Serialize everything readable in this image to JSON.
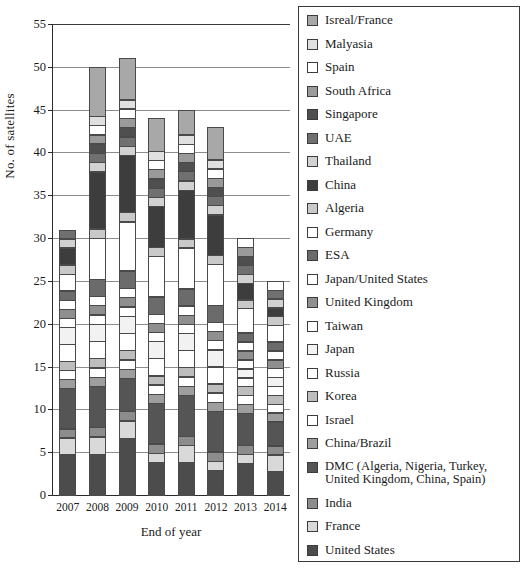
{
  "chart_data": {
    "type": "bar",
    "stacked": true,
    "title": "",
    "xlabel": "End of year",
    "ylabel": "No. of satellites",
    "categories": [
      "2007",
      "2008",
      "2009",
      "2010",
      "2011",
      "2012",
      "2013",
      "2014"
    ],
    "ylim": [
      0,
      55
    ],
    "yticks": [
      0,
      5,
      10,
      15,
      20,
      25,
      30,
      35,
      40,
      45,
      50,
      55
    ],
    "grid": true,
    "legend_position": "right",
    "totals": [
      31,
      49,
      51,
      44,
      45,
      42,
      29,
      24
    ],
    "series": [
      {
        "name": "United States",
        "color": "#4c4c4c",
        "values": [
          5,
          5,
          7,
          4,
          4,
          3,
          4,
          3
        ]
      },
      {
        "name": "France",
        "color": "#d9d9d9",
        "values": [
          2,
          2,
          2,
          1,
          2,
          1,
          1,
          2
        ]
      },
      {
        "name": "India",
        "color": "#8c8c8c",
        "values": [
          1,
          1,
          1,
          1,
          1,
          1,
          1,
          1
        ]
      },
      {
        "name": "DMC (Algeria, Nigeria, Turkey,\nUnited Kingdom, China, Spain)",
        "color": "#555555",
        "values": [
          5,
          5,
          4,
          5,
          5,
          5,
          4,
          3
        ]
      },
      {
        "name": "China/Brazil",
        "color": "#9e9e9e",
        "values": [
          1,
          1,
          1,
          1,
          1,
          1,
          1,
          1
        ]
      },
      {
        "name": "Israel",
        "color": "#ffffff",
        "values": [
          1,
          1,
          1,
          1,
          1,
          1,
          1,
          1
        ]
      },
      {
        "name": "Korea",
        "color": "#bdbdbd",
        "values": [
          1,
          1,
          1,
          1,
          1,
          1,
          1,
          1
        ]
      },
      {
        "name": "Russia",
        "color": "#ffffff",
        "values": [
          2,
          2,
          2,
          2,
          2,
          2,
          1,
          1
        ]
      },
      {
        "name": "Japan",
        "color": "#f2f2f2",
        "values": [
          2,
          2,
          2,
          2,
          2,
          2,
          1,
          1
        ]
      },
      {
        "name": "Taiwan",
        "color": "#ffffff",
        "values": [
          1,
          1,
          1,
          1,
          1,
          1,
          1,
          1
        ]
      },
      {
        "name": "United Kingdom",
        "color": "#8f8f8f",
        "values": [
          1,
          1,
          1,
          1,
          1,
          1,
          1,
          1
        ]
      },
      {
        "name": "Japan/United States",
        "color": "#ffffff",
        "values": [
          1,
          1,
          1,
          1,
          1,
          1,
          1,
          1
        ]
      },
      {
        "name": "ESA",
        "color": "#6b6b6b",
        "values": [
          1,
          2,
          2,
          2,
          2,
          2,
          1,
          1
        ]
      },
      {
        "name": "Germany",
        "color": "#ffffff",
        "values": [
          2,
          5,
          6,
          5,
          5,
          5,
          3,
          2
        ]
      },
      {
        "name": "Algeria",
        "color": "#c9c9c9",
        "values": [
          1,
          1,
          1,
          1,
          1,
          1,
          1,
          1
        ]
      },
      {
        "name": "China",
        "color": "#3d3d3d",
        "values": [
          2,
          7,
          7,
          5,
          6,
          5,
          2,
          1
        ]
      },
      {
        "name": "Thailand",
        "color": "#d2d2d2",
        "values": [
          1,
          1,
          1,
          1,
          1,
          1,
          1,
          1
        ]
      },
      {
        "name": "UAE",
        "color": "#707070",
        "values": [
          1,
          1,
          1,
          1,
          1,
          1,
          1,
          1
        ]
      },
      {
        "name": "Singapore",
        "color": "#4f4f4f",
        "values": [
          0,
          1,
          1,
          1,
          1,
          1,
          1,
          0
        ]
      },
      {
        "name": "South Africa",
        "color": "#9a9a9a",
        "values": [
          0,
          1,
          1,
          1,
          1,
          1,
          1,
          0
        ]
      },
      {
        "name": "Spain",
        "color": "#ffffff",
        "values": [
          0,
          1,
          1,
          1,
          1,
          1,
          1,
          1
        ]
      },
      {
        "name": "Malyasia",
        "color": "#e0e0e0",
        "values": [
          0,
          1,
          1,
          1,
          1,
          1,
          0,
          0
        ]
      },
      {
        "name": "Isreal/France",
        "color": "#a8a8a8",
        "values": [
          0,
          6,
          5,
          4,
          3,
          4,
          0,
          0
        ]
      }
    ]
  },
  "legend": {
    "items": [
      {
        "label": "Isreal/France",
        "color": "#a8a8a8"
      },
      {
        "label": "Malyasia",
        "color": "#e0e0e0"
      },
      {
        "label": "Spain",
        "color": "#ffffff"
      },
      {
        "label": "South Africa",
        "color": "#9a9a9a"
      },
      {
        "label": "Singapore",
        "color": "#4f4f4f"
      },
      {
        "label": "UAE",
        "color": "#707070"
      },
      {
        "label": "Thailand",
        "color": "#d2d2d2"
      },
      {
        "label": "China",
        "color": "#3d3d3d"
      },
      {
        "label": "Algeria",
        "color": "#c9c9c9"
      },
      {
        "label": "Germany",
        "color": "#ffffff"
      },
      {
        "label": "ESA",
        "color": "#6b6b6b"
      },
      {
        "label": "Japan/United States",
        "color": "#ffffff"
      },
      {
        "label": "United Kingdom",
        "color": "#8f8f8f"
      },
      {
        "label": "Taiwan",
        "color": "#ffffff"
      },
      {
        "label": "Japan",
        "color": "#f2f2f2"
      },
      {
        "label": "Russia",
        "color": "#ffffff"
      },
      {
        "label": "Korea",
        "color": "#bdbdbd"
      },
      {
        "label": "Israel",
        "color": "#ffffff"
      },
      {
        "label": "China/Brazil",
        "color": "#9e9e9e"
      },
      {
        "label": "DMC (Algeria, Nigeria, Turkey,\nUnited Kingdom, China, Spain)",
        "color": "#555555"
      },
      {
        "label": "India",
        "color": "#8c8c8c"
      },
      {
        "label": "France",
        "color": "#d9d9d9"
      },
      {
        "label": "United States",
        "color": "#4c4c4c"
      }
    ]
  }
}
